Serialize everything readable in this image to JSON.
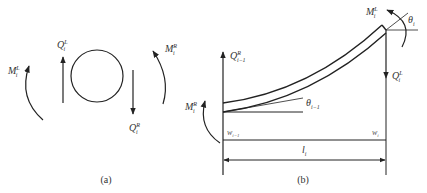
{
  "figure": {
    "panel_a": {
      "caption": "(a)",
      "labels": {
        "M_left": {
          "main": "M",
          "sup": "L",
          "sub": "i"
        },
        "Q_left": {
          "main": "Q",
          "sup": "L",
          "sub": "i"
        },
        "M_right": {
          "main": "M",
          "sup": "R",
          "sub": "i"
        },
        "Q_right": {
          "main": "Q",
          "sup": "R",
          "sub": "i"
        }
      }
    },
    "panel_b": {
      "caption": "(b)",
      "labels": {
        "Q_left": {
          "main": "Q",
          "sup": "R",
          "sub": "i−1"
        },
        "M_left": {
          "main": "M",
          "sup": "R",
          "sub": "i"
        },
        "M_right": {
          "main": "M",
          "sup": "L",
          "sub": "i"
        },
        "Q_right": {
          "main": "Q",
          "sup": "L",
          "sub": "i"
        },
        "theta_left": {
          "main": "θ",
          "sub": "i−1"
        },
        "theta_right": {
          "main": "θ",
          "sub": "i"
        },
        "w_left": {
          "main": "w",
          "sub": "i−1"
        },
        "w_right": {
          "main": "w",
          "sub": "i"
        },
        "length": {
          "main": "l",
          "sub": "i"
        }
      }
    }
  }
}
